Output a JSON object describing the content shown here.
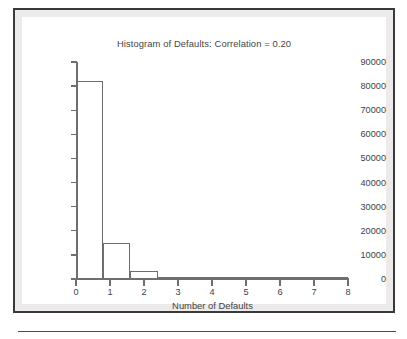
{
  "figure": {
    "title": "Histogram of Defaults: Correlation = 0.20",
    "x_axis_label": "Number of Defaults"
  },
  "chart_data": {
    "type": "bar",
    "title": "Histogram of Defaults: Correlation = 0.20",
    "xlabel": "Number of Defaults",
    "ylabel": "",
    "xlim": [
      0,
      8
    ],
    "ylim": [
      0,
      90000
    ],
    "grid": false,
    "legend": "none",
    "bin_width": 0.8,
    "x_tick_labels": [
      "0",
      "1",
      "2",
      "3",
      "4",
      "5",
      "6",
      "7",
      "8"
    ],
    "x_ticks": [
      0,
      1,
      2,
      3,
      4,
      5,
      6,
      7,
      8
    ],
    "y_tick_labels": [
      "0",
      "10000",
      "20000",
      "30000",
      "40000",
      "50000",
      "60000",
      "70000",
      "80000",
      "90000"
    ],
    "y_ticks": [
      0,
      10000,
      20000,
      30000,
      40000,
      50000,
      60000,
      70000,
      80000,
      90000
    ],
    "bins": [
      {
        "x0": 0.0,
        "x1": 0.8,
        "value": 82000
      },
      {
        "x0": 0.8,
        "x1": 1.6,
        "value": 15000
      },
      {
        "x0": 1.6,
        "x1": 2.4,
        "value": 3300
      },
      {
        "x0": 2.4,
        "x1": 3.2,
        "value": 600
      },
      {
        "x0": 3.2,
        "x1": 4.0,
        "value": 100
      },
      {
        "x0": 4.0,
        "x1": 4.8,
        "value": 0
      },
      {
        "x0": 4.8,
        "x1": 5.6,
        "value": 0
      },
      {
        "x0": 5.6,
        "x1": 6.4,
        "value": 0
      },
      {
        "x0": 6.4,
        "x1": 7.2,
        "value": 0
      },
      {
        "x0": 7.2,
        "x1": 8.0,
        "value": 0
      }
    ],
    "categories": [
      "0.0-0.8",
      "0.8-1.6",
      "1.6-2.4",
      "2.4-3.2",
      "3.2-4.0",
      "4.0-4.8",
      "4.8-5.6",
      "5.6-6.4",
      "6.4-7.2",
      "7.2-8.0"
    ],
    "values": [
      82000,
      15000,
      3300,
      600,
      100,
      0,
      0,
      0,
      0,
      0
    ],
    "colors": {
      "bar_outline": "#6d6d6d",
      "bar_fill": "#ffffff",
      "axis": "#6f6f6f",
      "text": "#3f3f3f",
      "frame": "#3a3a3a",
      "page_background": "#eceaea",
      "plot_background": "#ffffff"
    }
  }
}
